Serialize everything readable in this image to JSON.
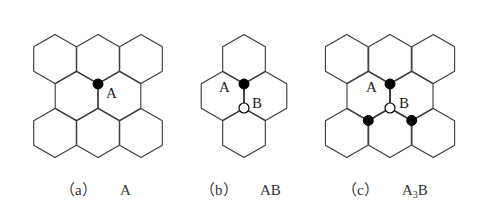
{
  "figure": {
    "hex_radius": 24.6,
    "colors": {
      "line": "#3a3a3a",
      "atom_a": "#000000",
      "atom_b_fill": "#ffffff"
    },
    "panels": [
      {
        "id": "a",
        "caption_label": "（a）",
        "caption_formula": "A",
        "hex_centers": [
          [
            55,
            59
          ],
          [
            98,
            59
          ],
          [
            141,
            59
          ],
          [
            76.5,
            96
          ],
          [
            119.5,
            96
          ],
          [
            55,
            133
          ],
          [
            98,
            133
          ],
          [
            141,
            133
          ]
        ],
        "atoms_a": [
          [
            98,
            84
          ]
        ],
        "atoms_b": [],
        "labels": [
          {
            "text": "A",
            "x": 106,
            "y": 98
          }
        ]
      },
      {
        "id": "b",
        "caption_label": "（b）",
        "caption_formula": "AB",
        "hex_centers": [
          [
            244,
            59
          ],
          [
            222.5,
            96
          ],
          [
            265.5,
            96
          ],
          [
            244,
            133
          ]
        ],
        "atoms_a": [
          [
            244,
            84
          ]
        ],
        "atoms_b": [
          [
            244,
            108
          ]
        ],
        "labels": [
          {
            "text": "A",
            "x": 220,
            "y": 92
          },
          {
            "text": "B",
            "x": 253,
            "y": 107
          }
        ]
      },
      {
        "id": "c",
        "caption_label": "（c）",
        "caption_formula_main": "A",
        "caption_formula_sub": "3",
        "caption_formula_tail": "B",
        "hex_centers": [
          [
            346.7,
            59
          ],
          [
            390,
            59
          ],
          [
            433.3,
            59
          ],
          [
            368.3,
            96
          ],
          [
            411.7,
            96
          ],
          [
            346.7,
            133
          ],
          [
            390,
            133
          ],
          [
            433.3,
            133
          ]
        ],
        "atoms_a": [
          [
            390,
            84
          ],
          [
            368.3,
            120.5
          ],
          [
            411.7,
            120.5
          ]
        ],
        "atoms_b": [
          [
            390,
            108
          ]
        ],
        "labels": [
          {
            "text": "A",
            "x": 367,
            "y": 92
          },
          {
            "text": "B",
            "x": 400,
            "y": 107
          }
        ]
      }
    ]
  },
  "captions": {
    "a_label": "（a）",
    "a_formula": "A",
    "b_label": "（b）",
    "b_formula": "AB",
    "c_label": "（c）",
    "c_formula_main": "A",
    "c_formula_sub": "3",
    "c_formula_tail": "B"
  },
  "labels": {
    "a_A": "A",
    "b_A": "A",
    "b_B": "B",
    "c_A": "A",
    "c_B": "B"
  }
}
